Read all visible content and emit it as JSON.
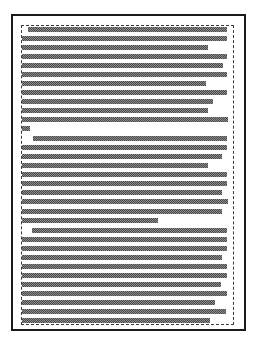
{
  "document": {
    "kind": "redacted-document-page",
    "title": "Redacted Document Page",
    "description": "Scanned page with all body text obscured by gray dithered bars",
    "page_width": 259,
    "page_height": 345,
    "background_color": "#ffffff"
  },
  "page_frame": {
    "name": "page-border",
    "left": 11,
    "top": 14,
    "width": 235,
    "height": 317,
    "border_width": 2,
    "border_color": "#1a1a1a",
    "border_style": "solid"
  },
  "text_block_boundary": {
    "name": "text-block-dotted-boundary",
    "left": 21,
    "top": 25,
    "width": 213,
    "height": 300,
    "border_width": 1,
    "border_color": "#3a3a3a",
    "border_style": "dashed"
  },
  "redaction": {
    "fill_color": "#8d8d8d",
    "dither_dark_color": "#4a4a4a",
    "pattern": "checkerboard-dither",
    "line_height": 5,
    "line_pitch": 9,
    "body_left": 22,
    "body_right": 228,
    "indent": 6
  },
  "paragraphs": [
    {
      "index": 0,
      "name": "paragraph-1",
      "first_line_indented": true,
      "line_count": 11
    },
    {
      "index": 1,
      "name": "paragraph-2",
      "first_line_indented": true,
      "line_count": 9
    },
    {
      "index": 2,
      "name": "paragraph-3",
      "first_line_indented": true,
      "line_count": 12
    }
  ],
  "lines": [
    {
      "id": 0,
      "paragraph": 0,
      "y": 27,
      "x": 28,
      "width": 199,
      "type": "first-line"
    },
    {
      "id": 1,
      "paragraph": 0,
      "y": 36,
      "x": 22,
      "width": 205,
      "type": "full"
    },
    {
      "id": 2,
      "paragraph": 0,
      "y": 45,
      "x": 22,
      "width": 186,
      "type": "short"
    },
    {
      "id": 3,
      "paragraph": 0,
      "y": 54,
      "x": 22,
      "width": 205,
      "type": "full"
    },
    {
      "id": 4,
      "paragraph": 0,
      "y": 63,
      "x": 22,
      "width": 201,
      "type": "full"
    },
    {
      "id": 5,
      "paragraph": 0,
      "y": 72,
      "x": 22,
      "width": 205,
      "type": "full"
    },
    {
      "id": 6,
      "paragraph": 0,
      "y": 81,
      "x": 22,
      "width": 184,
      "type": "short"
    },
    {
      "id": 7,
      "paragraph": 0,
      "y": 90,
      "x": 22,
      "width": 205,
      "type": "full"
    },
    {
      "id": 8,
      "paragraph": 0,
      "y": 99,
      "x": 22,
      "width": 191,
      "type": "short"
    },
    {
      "id": 9,
      "paragraph": 0,
      "y": 108,
      "x": 22,
      "width": 186,
      "type": "short"
    },
    {
      "id": 10,
      "paragraph": 0,
      "y": 117,
      "x": 22,
      "width": 206,
      "type": "last-line"
    },
    {
      "id": 11,
      "paragraph": 1,
      "y": 126,
      "x": 22,
      "width": 8,
      "type": "stub"
    },
    {
      "id": 12,
      "paragraph": 1,
      "y": 136,
      "x": 33,
      "width": 194,
      "type": "first-line"
    },
    {
      "id": 13,
      "paragraph": 1,
      "y": 145,
      "x": 22,
      "width": 205,
      "type": "full"
    },
    {
      "id": 14,
      "paragraph": 1,
      "y": 154,
      "x": 22,
      "width": 200,
      "type": "full"
    },
    {
      "id": 15,
      "paragraph": 1,
      "y": 163,
      "x": 22,
      "width": 186,
      "type": "short"
    },
    {
      "id": 16,
      "paragraph": 1,
      "y": 172,
      "x": 22,
      "width": 205,
      "type": "full"
    },
    {
      "id": 17,
      "paragraph": 1,
      "y": 181,
      "x": 22,
      "width": 205,
      "type": "full"
    },
    {
      "id": 18,
      "paragraph": 1,
      "y": 190,
      "x": 22,
      "width": 200,
      "type": "full"
    },
    {
      "id": 19,
      "paragraph": 1,
      "y": 199,
      "x": 22,
      "width": 206,
      "type": "full"
    },
    {
      "id": 20,
      "paragraph": 1,
      "y": 209,
      "x": 22,
      "width": 200,
      "type": "full"
    },
    {
      "id": 21,
      "paragraph": 1,
      "y": 218,
      "x": 22,
      "width": 136,
      "type": "last-line"
    },
    {
      "id": 22,
      "paragraph": 2,
      "y": 228,
      "x": 32,
      "width": 195,
      "type": "first-line"
    },
    {
      "id": 23,
      "paragraph": 2,
      "y": 237,
      "x": 22,
      "width": 205,
      "type": "full"
    },
    {
      "id": 24,
      "paragraph": 2,
      "y": 246,
      "x": 22,
      "width": 205,
      "type": "full"
    },
    {
      "id": 25,
      "paragraph": 2,
      "y": 255,
      "x": 22,
      "width": 200,
      "type": "full"
    },
    {
      "id": 26,
      "paragraph": 2,
      "y": 264,
      "x": 22,
      "width": 205,
      "type": "full"
    },
    {
      "id": 27,
      "paragraph": 2,
      "y": 273,
      "x": 22,
      "width": 205,
      "type": "full"
    },
    {
      "id": 28,
      "paragraph": 2,
      "y": 282,
      "x": 22,
      "width": 199,
      "type": "full"
    },
    {
      "id": 29,
      "paragraph": 2,
      "y": 291,
      "x": 22,
      "width": 205,
      "type": "full"
    },
    {
      "id": 30,
      "paragraph": 2,
      "y": 300,
      "x": 22,
      "width": 193,
      "type": "short"
    },
    {
      "id": 31,
      "paragraph": 2,
      "y": 309,
      "x": 22,
      "width": 204,
      "type": "full"
    },
    {
      "id": 32,
      "paragraph": 2,
      "y": 318,
      "x": 22,
      "width": 188,
      "type": "last-line"
    }
  ]
}
